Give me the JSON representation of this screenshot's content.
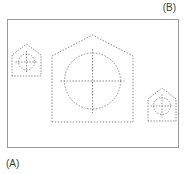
{
  "figure": {
    "title_visible": false,
    "labels": {
      "top_right": "(B)",
      "bottom_left": "(A)"
    },
    "colors": {
      "background": "#ffffff",
      "frame_stroke": "#9a9a9a",
      "dashed_stroke": "#8c8c8c",
      "label_text": "#3b3b3b"
    },
    "frame": {
      "x": 7,
      "y": 19,
      "width": 172,
      "height": 129,
      "stroke_width": 1,
      "style": "solid"
    },
    "shapes": [
      {
        "name": "small-house-left",
        "type": "pentagon-house",
        "stroke": "dashed",
        "left": 12,
        "top": 44,
        "width": 29,
        "height": 32,
        "roof_height": 11,
        "circle": {
          "cx": 26.5,
          "cy": 62,
          "r": 8,
          "crosshair": true,
          "crosshair_overhang": 3
        }
      },
      {
        "name": "large-house-center",
        "type": "pentagon-house",
        "stroke": "dashed",
        "left": 52,
        "top": 35,
        "width": 81,
        "height": 87,
        "roof_height": 21,
        "circle": {
          "cx": 92.5,
          "cy": 81,
          "r": 28,
          "crosshair": true,
          "crosshair_overhang": 9
        }
      },
      {
        "name": "small-house-right",
        "type": "pentagon-house",
        "stroke": "dashed",
        "left": 148,
        "top": 88,
        "width": 28,
        "height": 33,
        "roof_height": 11,
        "circle": {
          "cx": 162,
          "cy": 106,
          "r": 8.5,
          "crosshair": true,
          "crosshair_overhang": 3
        }
      }
    ]
  }
}
